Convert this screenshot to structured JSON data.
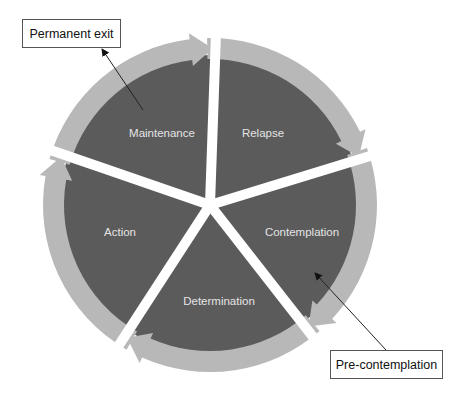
{
  "diagram": {
    "stages": [
      {
        "id": "relapse",
        "label": "Relapse"
      },
      {
        "id": "contemplation",
        "label": "Contemplation"
      },
      {
        "id": "determination",
        "label": "Determination"
      },
      {
        "id": "action",
        "label": "Action"
      },
      {
        "id": "maintenance",
        "label": "Maintenance"
      }
    ],
    "callouts": {
      "exit": "Permanent exit",
      "entry": "Pre-contemplation"
    },
    "colors": {
      "sector_fill": "#5b5b5b",
      "ring_arrow_fill": "#b8b8b8",
      "gap": "#ffffff",
      "label_text": "#e4e4e4"
    }
  }
}
